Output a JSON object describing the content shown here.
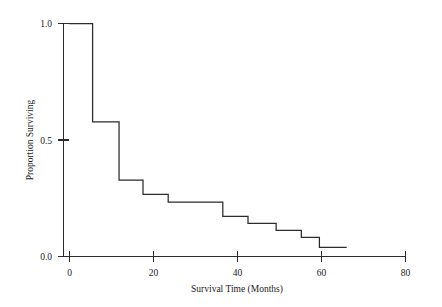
{
  "chart_data": {
    "type": "line",
    "subtype": "kaplan-meier-step",
    "title": "",
    "xlabel": "Survival Time (Months)",
    "ylabel": "Proportion Surviving",
    "xlim": [
      0,
      80
    ],
    "ylim": [
      0.0,
      1.0
    ],
    "xticks": [
      0,
      20,
      40,
      60,
      80
    ],
    "xtick_labels": [
      "0",
      "20",
      "40",
      "60",
      "80"
    ],
    "yticks": [
      0.0,
      0.5,
      1.0
    ],
    "ytick_labels": [
      "0.0",
      "0.5",
      "1.0"
    ],
    "grid": false,
    "legend": null,
    "series": [
      {
        "name": "Proportion Surviving",
        "color": "#2b2b2b",
        "x": [
          0,
          5.5,
          5.5,
          11.8,
          11.8,
          17.5,
          17.5,
          23.5,
          23.5,
          36.5,
          36.5,
          42.5,
          42.5,
          49.2,
          49.2,
          55.2,
          55.2,
          59.5,
          59.5,
          66.0
        ],
        "y": [
          1.0,
          1.0,
          0.578,
          0.578,
          0.328,
          0.328,
          0.267,
          0.267,
          0.233,
          0.233,
          0.172,
          0.172,
          0.142,
          0.142,
          0.112,
          0.112,
          0.082,
          0.082,
          0.039,
          0.039
        ]
      }
    ],
    "steps": [
      {
        "time": 0.0,
        "proportion": 1.0
      },
      {
        "time": 5.5,
        "proportion": 0.578
      },
      {
        "time": 11.8,
        "proportion": 0.328
      },
      {
        "time": 17.5,
        "proportion": 0.267
      },
      {
        "time": 23.5,
        "proportion": 0.233
      },
      {
        "time": 36.5,
        "proportion": 0.172
      },
      {
        "time": 42.5,
        "proportion": 0.142
      },
      {
        "time": 49.2,
        "proportion": 0.112
      },
      {
        "time": 55.2,
        "proportion": 0.082
      },
      {
        "time": 59.5,
        "proportion": 0.039
      },
      {
        "time": 66.0,
        "proportion": 0.039
      }
    ]
  },
  "axes": {
    "x_title": "Survival Time (Months)",
    "y_title": "Proportion Surviving",
    "x_tick_labels": [
      "0",
      "20",
      "40",
      "60",
      "80"
    ],
    "y_tick_labels": [
      "0.0",
      "0.5",
      "1.0"
    ]
  },
  "colors": {
    "curve": "#2b2b2b",
    "axis": "#2b2b2b",
    "background": "#ffffff",
    "text": "#1a1a1a"
  }
}
